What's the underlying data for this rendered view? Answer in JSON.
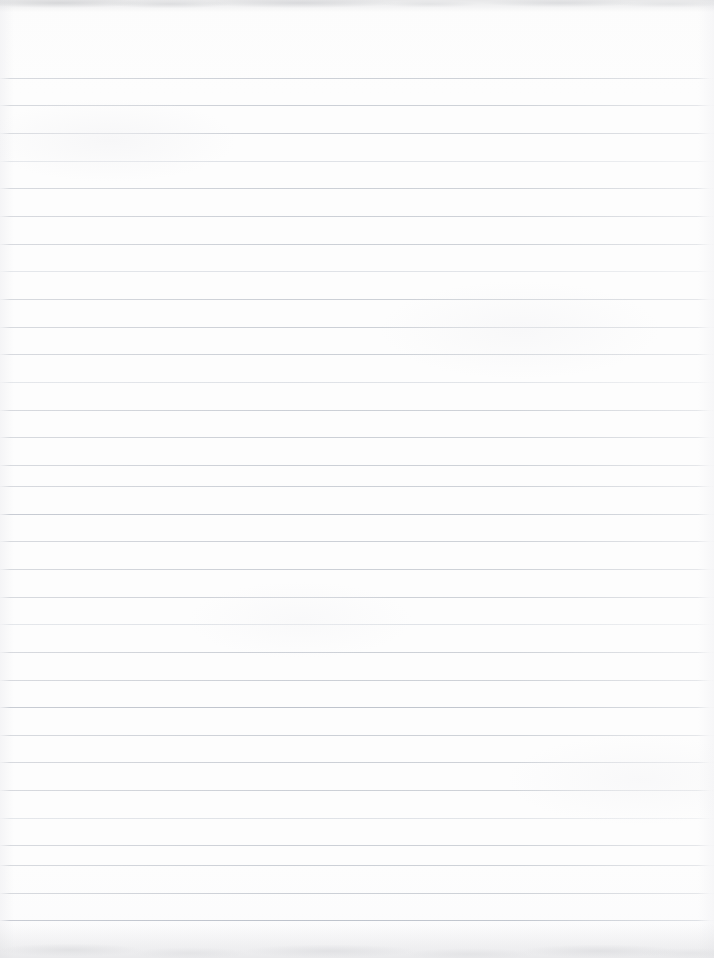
{
  "document": {
    "kind": "scanned-ruled-notebook-page",
    "title": "Blank Ruled Notebook Page",
    "content_text": "",
    "has_handwriting": false,
    "has_printed_text": false,
    "page_width_px": 714,
    "page_height_px": 958
  },
  "paper": {
    "background_color": "#fdfdfd",
    "edge_tint_color": "#f3f3f5",
    "top_margin_px": 78,
    "bottom_margin_px": 38
  },
  "ruling": {
    "style": "horizontal-ruled",
    "line_color": "#c9cdd4",
    "line_color_strong": "#bec3cc",
    "line_color_faint": "#d6dae0",
    "line_thickness_px": 1,
    "line_spacing_px": 27.6,
    "first_line_y_px": 78,
    "last_line_y_px": 920,
    "line_start_x_px": 0,
    "line_end_x_px": 706,
    "line_count": 31,
    "has_vertical_margin_rule": false,
    "lines": [
      {
        "y": 78,
        "weight": "normal"
      },
      {
        "y": 105,
        "weight": "normal"
      },
      {
        "y": 133,
        "weight": "normal"
      },
      {
        "y": 161,
        "weight": "faint"
      },
      {
        "y": 188,
        "weight": "normal"
      },
      {
        "y": 216,
        "weight": "normal"
      },
      {
        "y": 244,
        "weight": "normal"
      },
      {
        "y": 271,
        "weight": "faint"
      },
      {
        "y": 299,
        "weight": "normal"
      },
      {
        "y": 327,
        "weight": "normal"
      },
      {
        "y": 354,
        "weight": "normal"
      },
      {
        "y": 382,
        "weight": "faint"
      },
      {
        "y": 410,
        "weight": "normal"
      },
      {
        "y": 437,
        "weight": "normal"
      },
      {
        "y": 465,
        "weight": "normal"
      },
      {
        "y": 486,
        "weight": "normal"
      },
      {
        "y": 514,
        "weight": "strong"
      },
      {
        "y": 541,
        "weight": "normal"
      },
      {
        "y": 569,
        "weight": "normal"
      },
      {
        "y": 597,
        "weight": "normal"
      },
      {
        "y": 624,
        "weight": "faint"
      },
      {
        "y": 652,
        "weight": "normal"
      },
      {
        "y": 680,
        "weight": "normal"
      },
      {
        "y": 707,
        "weight": "strong"
      },
      {
        "y": 735,
        "weight": "normal"
      },
      {
        "y": 762,
        "weight": "normal"
      },
      {
        "y": 790,
        "weight": "normal"
      },
      {
        "y": 818,
        "weight": "faint"
      },
      {
        "y": 845,
        "weight": "normal"
      },
      {
        "y": 865,
        "weight": "normal"
      },
      {
        "y": 893,
        "weight": "normal"
      },
      {
        "y": 920,
        "weight": "strong"
      }
    ]
  },
  "scan_artifacts": {
    "top_band": {
      "height_px": 12,
      "color": "#ced0d3",
      "description": "smudged grey scan edge"
    },
    "bottom_band": {
      "height_px": 34,
      "color": "#d1d2d5",
      "description": "mottled grey scan edge"
    }
  }
}
